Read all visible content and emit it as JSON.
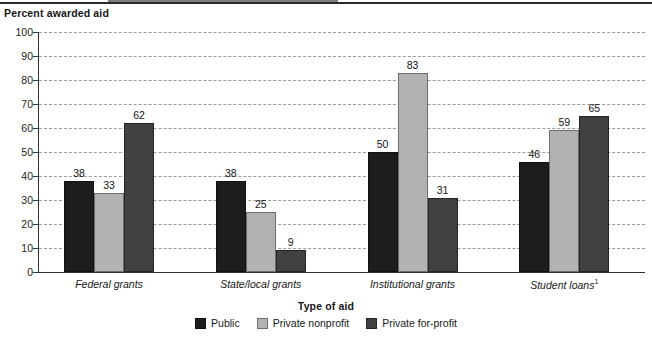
{
  "figure": {
    "y_axis_title": "Percent awarded aid",
    "x_axis_title": "Type of aid"
  },
  "chart_data": {
    "type": "bar",
    "title": "",
    "subtitle": "",
    "xlabel": "Type of aid",
    "ylabel": "Percent awarded aid",
    "ylim": [
      0,
      100
    ],
    "ytick_labels": [
      "0",
      "10",
      "20",
      "30",
      "40",
      "50",
      "60",
      "70",
      "80",
      "90",
      "100"
    ],
    "ytick_values": [
      0,
      10,
      20,
      30,
      40,
      50,
      60,
      70,
      80,
      90,
      100
    ],
    "grid": "horizontal-dashed",
    "legend_position": "bottom-center",
    "categories": [
      "Federal grants",
      "State/local grants",
      "Institutional grants",
      "Student loans"
    ],
    "category_footnotes": [
      "",
      "",
      "",
      "1"
    ],
    "series": [
      {
        "name": "Public",
        "color": "#1d1d1d",
        "values": [
          38,
          38,
          50,
          46
        ]
      },
      {
        "name": "Private nonprofit",
        "color": "#b2b2b2",
        "values": [
          33,
          25,
          83,
          59
        ]
      },
      {
        "name": "Private for-profit",
        "color": "#414141",
        "values": [
          62,
          9,
          31,
          65
        ]
      }
    ]
  },
  "legend": {
    "items": [
      {
        "label": "Public",
        "series": 0
      },
      {
        "label": "Private nonprofit",
        "series": 1
      },
      {
        "label": "Private for-profit",
        "series": 2
      }
    ]
  }
}
